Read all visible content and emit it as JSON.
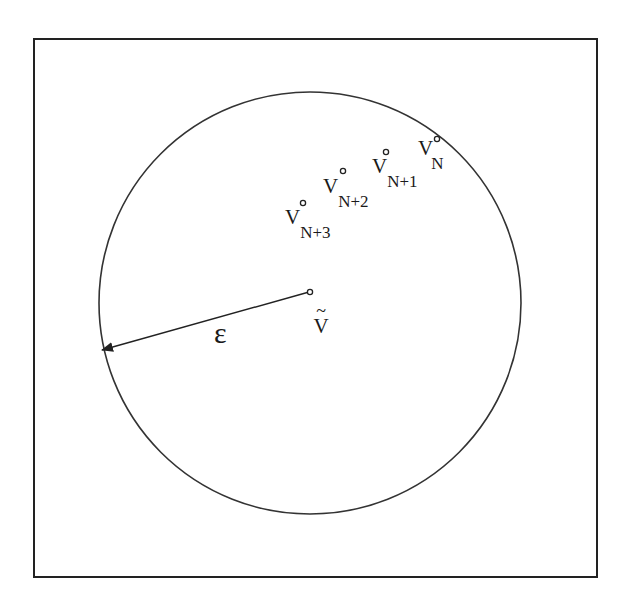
{
  "diagram": {
    "type": "epsilon-neighborhood",
    "colors": {
      "stroke": "#222222",
      "background": "#ffffff",
      "text": "#1a1a1a"
    },
    "circle": {
      "cx": 310,
      "cy": 303,
      "r": 211
    },
    "center_point": {
      "x": 309,
      "y": 292,
      "label_main": "V",
      "label_accent": "~"
    },
    "radius_arrow": {
      "from": [
        309,
        292
      ],
      "to": [
        101,
        350
      ],
      "label": "ε"
    },
    "points": [
      {
        "id": "vN",
        "x": 437,
        "y": 139,
        "label_main": "V",
        "label_sub": "N"
      },
      {
        "id": "vN1",
        "x": 386,
        "y": 152,
        "label_main": "V",
        "label_sub": "N+1"
      },
      {
        "id": "vN2",
        "x": 343,
        "y": 171,
        "label_main": "V",
        "label_sub": "N+2"
      },
      {
        "id": "vN3",
        "x": 303,
        "y": 203,
        "label_main": "V",
        "label_sub": "N+3"
      }
    ]
  }
}
